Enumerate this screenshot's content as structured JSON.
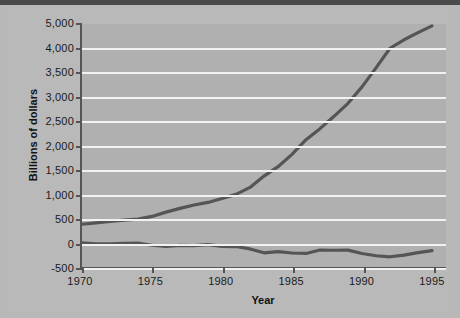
{
  "chart_data": {
    "type": "line",
    "title": "",
    "xlabel": "Year",
    "ylabel": "Billions of dollars",
    "xlim": [
      1970,
      1996
    ],
    "ylim": [
      -500,
      5000
    ],
    "grid": true,
    "legend": "none",
    "xticks": [
      "1970",
      "1975",
      "1980",
      "1985",
      "1990",
      "1995"
    ],
    "xtick_values": [
      1970,
      1975,
      1980,
      1985,
      1990,
      1995
    ],
    "yticks": [
      "5,000",
      "4,000",
      "3,500",
      "3,000",
      "2,500",
      "2,000",
      "1,500",
      "1,000",
      "500",
      "0",
      "-500"
    ],
    "ytick_values": [
      5000,
      4000,
      3500,
      3000,
      2500,
      2000,
      1500,
      1000,
      500,
      0,
      -500
    ],
    "x": [
      1970,
      1971,
      1972,
      1973,
      1974,
      1975,
      1976,
      1977,
      1978,
      1979,
      1980,
      1981,
      1982,
      1983,
      1984,
      1985,
      1986,
      1987,
      1988,
      1989,
      1990,
      1991,
      1992,
      1993,
      1994,
      1995
    ],
    "series": [
      {
        "name": "Gross federal debt",
        "color": "#555555",
        "values": [
          380,
          408,
          436,
          466,
          484,
          541,
          629,
          706,
          777,
          829,
          909,
          994,
          1137,
          1371,
          1564,
          1817,
          2120,
          2346,
          2601,
          2868,
          3206,
          3598,
          4002,
          4351,
          4643,
          4921
        ]
      },
      {
        "name": "Federal surplus or deficit",
        "color": "#555555",
        "values": [
          -3,
          -23,
          -23,
          -15,
          -6,
          -53,
          -74,
          -54,
          -59,
          -41,
          -74,
          -79,
          -128,
          -208,
          -185,
          -212,
          -221,
          -150,
          -155,
          -152,
          -221,
          -269,
          -290,
          -255,
          -203,
          -164
        ]
      }
    ]
  },
  "axes": {
    "y_title": "Billions of dollars",
    "x_title": "Year"
  }
}
